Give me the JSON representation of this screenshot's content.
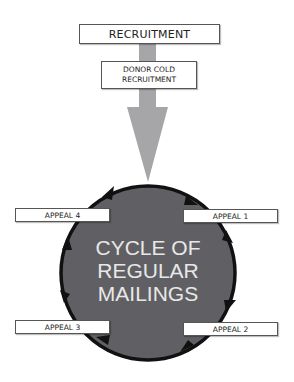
{
  "diagram": {
    "top_box": {
      "label": "RECRUITMENT"
    },
    "sub_box": {
      "line1": "DONOR COLD",
      "line2": "RECRUITMENT"
    },
    "cycle": {
      "line1": "CYCLE OF",
      "line2": "REGULAR",
      "line3": "MAILINGS",
      "direction": "clockwise"
    },
    "appeals": [
      {
        "label": "APPEAL 1"
      },
      {
        "label": "APPEAL 2"
      },
      {
        "label": "APPEAL 3"
      },
      {
        "label": "APPEAL 4"
      }
    ],
    "colors": {
      "arrow": "#a6a6a8",
      "circle_fill": "#606064",
      "ring": "#111111",
      "center_text": "#e8e8e8"
    }
  }
}
